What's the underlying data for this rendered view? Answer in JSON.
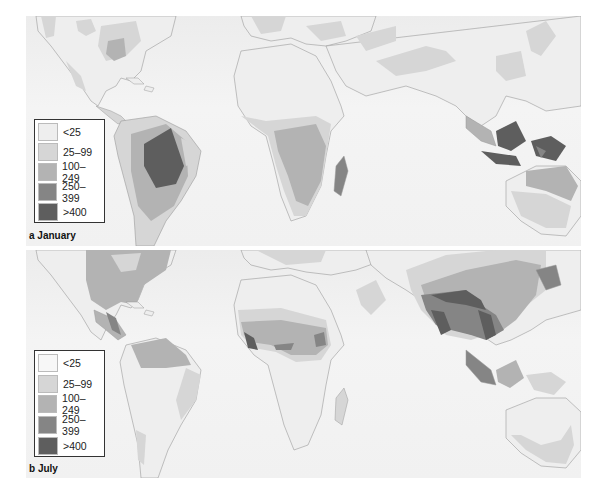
{
  "legend": {
    "unit": "mm",
    "classes": [
      {
        "label": "<25",
        "color": "#eeeeee"
      },
      {
        "label": "25–99",
        "color": "#d6d6d6"
      },
      {
        "label": "100–249",
        "color": "#b3b3b3"
      },
      {
        "label": "250–399",
        "color": "#858585"
      },
      {
        "label": ">400",
        "color": "#5e5e5e"
      }
    ]
  },
  "panels": [
    {
      "id": "a",
      "label": "a January",
      "month": "January"
    },
    {
      "id": "b",
      "label": "b July",
      "month": "July"
    }
  ],
  "colors": {
    "background": "#f2f2f2",
    "c1": "#eeeeee",
    "c2": "#d6d6d6",
    "c3": "#b3b3b3",
    "c4": "#858585",
    "c5": "#5e5e5e",
    "coast": "#9a9a9a"
  }
}
